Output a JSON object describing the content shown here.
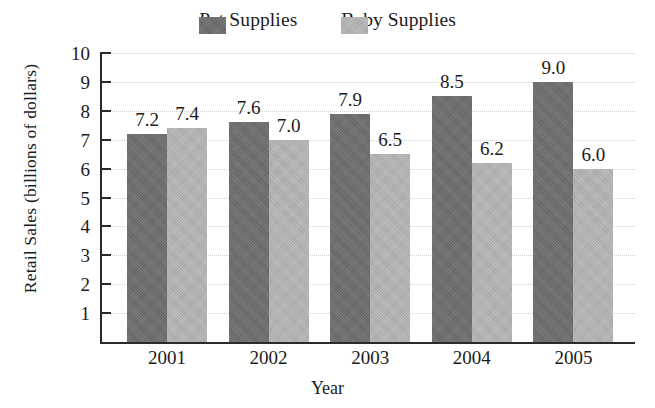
{
  "chart_data": {
    "type": "bar",
    "title": "",
    "xlabel": "Year",
    "ylabel": "Retail Sales (billions of dollars)",
    "categories": [
      "2001",
      "2002",
      "2003",
      "2004",
      "2005"
    ],
    "series": [
      {
        "name": "Pet Supplies",
        "color": "#6c6c6c",
        "values": [
          7.2,
          7.6,
          7.9,
          8.5,
          9.0
        ],
        "labels": [
          "7.2",
          "7.6",
          "7.9",
          "8.5",
          "9.0"
        ]
      },
      {
        "name": "Baby Supplies",
        "color": "#b1b1b1",
        "values": [
          7.4,
          7.0,
          6.5,
          6.2,
          6.0
        ],
        "labels": [
          "7.4",
          "7.0",
          "6.5",
          "6.2",
          "6.0"
        ]
      }
    ],
    "ylim": [
      0,
      10
    ],
    "ytick_labels": [
      "10",
      "9",
      "8",
      "7",
      "6",
      "5",
      "4",
      "3",
      "2",
      "1"
    ],
    "ytick_values": [
      10,
      9,
      8,
      7,
      6,
      5,
      4,
      3,
      2,
      1
    ],
    "grid": true,
    "grid_axis": "y",
    "legend_position": "top-center",
    "background_color": "#ffffff",
    "axis_color": "#2b2b2b"
  },
  "legend": {
    "entries": [
      {
        "label": "Pet Supplies",
        "swatch_name": "legend-swatch-pet-supplies"
      },
      {
        "label": "Baby Supplies",
        "swatch_name": "legend-swatch-baby-supplies"
      }
    ]
  },
  "axes": {
    "y_title": "Retail Sales (billions of dollars)",
    "x_title": "Year"
  }
}
